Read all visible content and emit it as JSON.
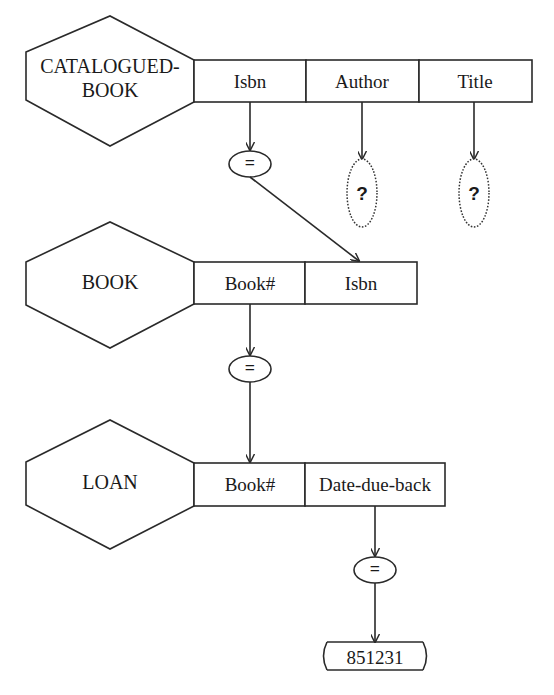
{
  "diagram": {
    "type": "query-by-diagram",
    "entities": [
      {
        "name_line1": "CATALOGUED-",
        "name_line2": "BOOK",
        "attributes": [
          "Isbn",
          "Author",
          "Title"
        ]
      },
      {
        "name": "BOOK",
        "attributes": [
          "Book#",
          "Isbn"
        ]
      },
      {
        "name": "LOAN",
        "attributes": [
          "Book#",
          "Date-due-back"
        ]
      }
    ],
    "operators": {
      "eq1": "=",
      "eq2": "=",
      "eq3": "="
    },
    "outputs": {
      "author": "?",
      "title": "?"
    },
    "constant": "851231",
    "colors": {
      "stroke": "#2a2a2a",
      "background": "#ffffff"
    }
  }
}
